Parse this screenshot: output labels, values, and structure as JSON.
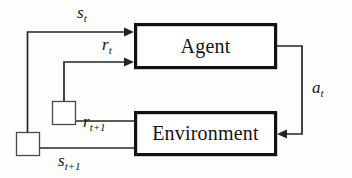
{
  "figure": {
    "kind": "block-diagram",
    "background_color": "#fdfdfc",
    "line_color": "#242424",
    "box_border_color": "#111111",
    "box_fill_color": "#ffffff"
  },
  "nodes": [
    {
      "id": "agent",
      "label": "Agent",
      "x": 134,
      "y": 23,
      "width": 143,
      "height": 46
    },
    {
      "id": "environment",
      "label": "Environment",
      "x": 134,
      "y": 111,
      "width": 143,
      "height": 45
    }
  ],
  "delay_elements": [
    {
      "id": "reward-delay",
      "x": 52,
      "y": 101,
      "size": 24
    },
    {
      "id": "state-delay",
      "x": 16,
      "y": 132,
      "size": 24
    }
  ],
  "signals": [
    {
      "id": "state-t",
      "symbol": "s",
      "subscript": "t",
      "label": "s_t",
      "from": "state-delay",
      "to": "agent",
      "label_x": 77,
      "label_y": 4
    },
    {
      "id": "reward-t",
      "symbol": "r",
      "subscript": "t",
      "label": "r_t",
      "from": "reward-delay",
      "to": "agent",
      "label_x": 102,
      "label_y": 36
    },
    {
      "id": "action-t",
      "symbol": "a",
      "subscript": "t",
      "label": "a_t",
      "from": "agent",
      "to": "environment",
      "label_x": 312,
      "label_y": 79
    },
    {
      "id": "reward-t-plus-1",
      "symbol": "r",
      "subscript": "t+1",
      "label": "r_t+1",
      "from": "environment",
      "to": "reward-delay",
      "label_x": 83,
      "label_y": 113
    },
    {
      "id": "state-t-plus-1",
      "symbol": "s",
      "subscript": "t+1",
      "label": "s_t+1",
      "from": "environment",
      "to": "state-delay",
      "label_x": 58,
      "label_y": 152
    }
  ]
}
